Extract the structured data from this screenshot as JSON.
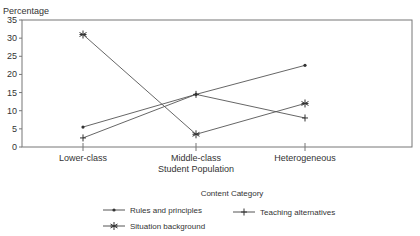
{
  "chart_data": {
    "type": "line",
    "title": "",
    "ylabel": "Percentage",
    "xlabel": "Student Population",
    "legend_title": "Content Category",
    "categories": [
      "Lower-class",
      "Middle-class",
      "Heterogeneous"
    ],
    "ylim": [
      0,
      35
    ],
    "yticks": [
      0,
      5,
      10,
      15,
      20,
      25,
      30,
      35
    ],
    "grid": false,
    "legend_position": "bottom",
    "series": [
      {
        "name": "Rules and principles",
        "marker": "dot",
        "values": [
          5.5,
          14.5,
          22.5
        ]
      },
      {
        "name": "Teaching alternatives",
        "marker": "plus",
        "values": [
          2.5,
          14.5,
          8
        ]
      },
      {
        "name": "Situation background",
        "marker": "asterisk",
        "values": [
          31,
          3.5,
          12
        ]
      }
    ]
  }
}
